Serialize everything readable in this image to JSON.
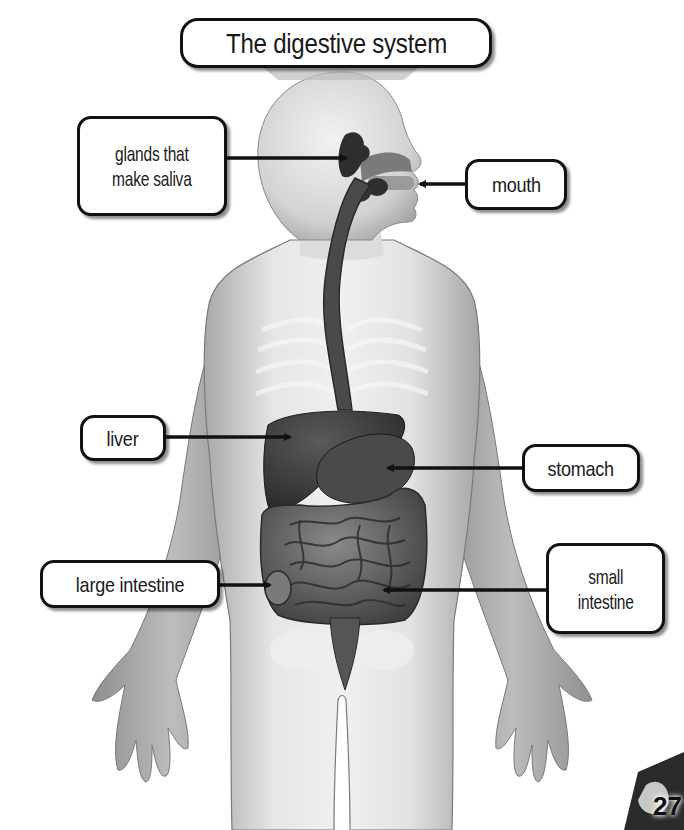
{
  "title": "The digestive system",
  "labels": [
    {
      "id": "glands",
      "lines": [
        "glands that",
        "make saliva"
      ]
    },
    {
      "id": "mouth",
      "lines": [
        "mouth"
      ]
    },
    {
      "id": "liver",
      "lines": [
        "liver"
      ]
    },
    {
      "id": "stomach",
      "lines": [
        "stomach"
      ]
    },
    {
      "id": "large_intestine",
      "lines": [
        "large intestine"
      ]
    },
    {
      "id": "small_intestine",
      "lines": [
        "small",
        "intestine"
      ]
    }
  ],
  "page_number": "27",
  "colors": {
    "background": "#ffffff",
    "body_fill": "#d9d9d9",
    "organ_dark": "#3a3a3a",
    "label_border": "#111111"
  }
}
